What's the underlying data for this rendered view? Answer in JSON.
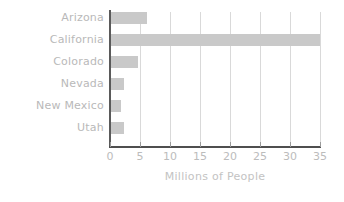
{
  "chart_data": {
    "type": "bar",
    "orientation": "horizontal",
    "title": "",
    "xlabel": "Millions of People",
    "ylabel": "",
    "categories": [
      "Arizona",
      "California",
      "Colorado",
      "Nevada",
      "New Mexico",
      "Utah"
    ],
    "values": [
      6.1,
      35.0,
      4.6,
      2.4,
      1.8,
      2.4
    ],
    "xlim": [
      0,
      35
    ],
    "xticks": [
      0,
      5,
      10,
      15,
      20,
      25,
      30,
      35
    ],
    "xtick_labels": [
      "0",
      "5",
      "10",
      "15",
      "20",
      "25",
      "30",
      "35"
    ],
    "grid": "vertical",
    "legend": "none",
    "colors": {
      "bar": "#c9c9c9",
      "gridline": "#d9d9d9",
      "axis": "#4f4f4f",
      "label_text": "#b9b9b9",
      "tick_text": "#bcbcbc",
      "axis_title_text": "#c3c3c3",
      "background": "#ffffff"
    }
  }
}
